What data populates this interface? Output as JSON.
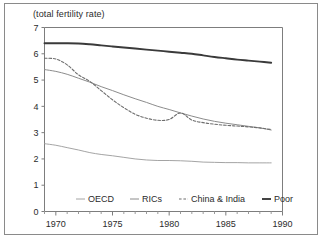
{
  "chart_data": {
    "type": "line",
    "title": "(total fertility rate)",
    "xlabel": "",
    "ylabel": "",
    "xlim": [
      1969,
      1990
    ],
    "ylim": [
      0,
      7
    ],
    "xticks": [
      1970,
      1975,
      1980,
      1985,
      1990
    ],
    "yticks": [
      0,
      1,
      2,
      3,
      4,
      5,
      6,
      7
    ],
    "grid": false,
    "legend_position": "bottom-center",
    "series": [
      {
        "name": "OECD",
        "style": "solid-light",
        "color": "#9a9a9a",
        "x": [
          1969,
          1970,
          1971,
          1972,
          1973,
          1974,
          1975,
          1976,
          1977,
          1978,
          1979,
          1980,
          1981,
          1982,
          1983,
          1984,
          1985,
          1986,
          1987,
          1988,
          1989
        ],
        "values": [
          2.58,
          2.52,
          2.43,
          2.34,
          2.24,
          2.17,
          2.12,
          2.06,
          2.0,
          1.96,
          1.94,
          1.94,
          1.93,
          1.91,
          1.88,
          1.87,
          1.86,
          1.86,
          1.85,
          1.85,
          1.85
        ]
      },
      {
        "name": "RICs",
        "style": "solid-medium",
        "color": "#8c8c8c",
        "x": [
          1969,
          1970,
          1971,
          1972,
          1973,
          1974,
          1975,
          1976,
          1977,
          1978,
          1979,
          1980,
          1981,
          1982,
          1983,
          1984,
          1985,
          1986,
          1987,
          1988,
          1989
        ],
        "values": [
          5.4,
          5.33,
          5.22,
          5.07,
          4.92,
          4.75,
          4.6,
          4.44,
          4.29,
          4.15,
          4.0,
          3.88,
          3.75,
          3.63,
          3.52,
          3.43,
          3.36,
          3.3,
          3.24,
          3.18,
          3.1
        ]
      },
      {
        "name": "China & India",
        "style": "dashed",
        "color": "#6e6e6e",
        "x": [
          1969,
          1970,
          1971,
          1972,
          1973,
          1974,
          1975,
          1976,
          1977,
          1978,
          1979,
          1980,
          1981,
          1982,
          1983,
          1984,
          1985,
          1986,
          1987,
          1988,
          1989
        ],
        "values": [
          5.83,
          5.8,
          5.58,
          5.2,
          4.95,
          4.6,
          4.25,
          3.95,
          3.7,
          3.55,
          3.47,
          3.5,
          3.75,
          3.48,
          3.38,
          3.32,
          3.28,
          3.25,
          3.22,
          3.18,
          3.12
        ]
      },
      {
        "name": "Poor",
        "style": "solid-dark",
        "color": "#3a3a3a",
        "x": [
          1969,
          1970,
          1971,
          1972,
          1973,
          1974,
          1975,
          1976,
          1977,
          1978,
          1979,
          1980,
          1981,
          1982,
          1983,
          1984,
          1985,
          1986,
          1987,
          1988,
          1989
        ],
        "values": [
          6.4,
          6.4,
          6.4,
          6.39,
          6.36,
          6.32,
          6.28,
          6.24,
          6.2,
          6.16,
          6.12,
          6.08,
          6.04,
          6.0,
          5.94,
          5.88,
          5.83,
          5.78,
          5.74,
          5.7,
          5.66
        ]
      }
    ]
  },
  "legend": {
    "items": [
      {
        "label": "OECD"
      },
      {
        "label": "RICs"
      },
      {
        "label": "China & India"
      },
      {
        "label": "Poor"
      }
    ]
  }
}
